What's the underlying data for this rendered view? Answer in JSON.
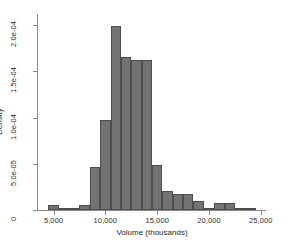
{
  "chart_data": {
    "type": "bar",
    "title": "",
    "subtitle": "",
    "xlabel": "Volume (thousands)",
    "ylabel": "Density",
    "xlim": [
      3500,
      25500
    ],
    "ylim": [
      0,
      0.000212
    ],
    "grid": false,
    "legend": null,
    "bin_width": 1000,
    "xticks": [
      5000,
      10000,
      15000,
      20000,
      25000
    ],
    "xtick_labels": [
      "5,000",
      "10,000",
      "15,000",
      "20,000",
      "25,000"
    ],
    "yticks": [
      0,
      5e-05,
      0.0001,
      0.00015,
      0.0002
    ],
    "ytick_labels": [
      "0",
      "5.0e-05",
      "1.0e-04",
      "1.5e-04",
      "2.0e-04"
    ],
    "bar_color": "#737373",
    "bar_edge_color": "#4d4d4d",
    "axis_color": "#8a8a8a",
    "bins": [
      {
        "x0": 4500,
        "x1": 5500,
        "density": 5.5e-06
      },
      {
        "x0": 5500,
        "x1": 6500,
        "density": 2.2e-06
      },
      {
        "x0": 6500,
        "x1": 7500,
        "density": 2.2e-06
      },
      {
        "x0": 7500,
        "x1": 8500,
        "density": 5.5e-06
      },
      {
        "x0": 8500,
        "x1": 9500,
        "density": 4.6e-05
      },
      {
        "x0": 9500,
        "x1": 10500,
        "density": 9.75e-05
      },
      {
        "x0": 10500,
        "x1": 11500,
        "density": 0.0001985
      },
      {
        "x0": 11500,
        "x1": 12500,
        "density": 0.000166
      },
      {
        "x0": 12500,
        "x1": 13500,
        "density": 0.0001625
      },
      {
        "x0": 13500,
        "x1": 14500,
        "density": 0.0001625
      },
      {
        "x0": 14500,
        "x1": 15500,
        "density": 4.9e-05
      },
      {
        "x0": 15500,
        "x1": 16500,
        "density": 2.05e-05
      },
      {
        "x0": 16500,
        "x1": 17500,
        "density": 1.75e-05
      },
      {
        "x0": 17500,
        "x1": 18500,
        "density": 1.75e-05
      },
      {
        "x0": 18500,
        "x1": 19500,
        "density": 1e-05
      },
      {
        "x0": 19500,
        "x1": 20500,
        "density": 2.2e-06
      },
      {
        "x0": 20500,
        "x1": 21500,
        "density": 7.2e-06
      },
      {
        "x0": 21500,
        "x1": 22500,
        "density": 7.2e-06
      },
      {
        "x0": 22500,
        "x1": 23500,
        "density": 2.2e-06
      },
      {
        "x0": 23500,
        "x1": 24500,
        "density": 2.2e-06
      }
    ]
  }
}
